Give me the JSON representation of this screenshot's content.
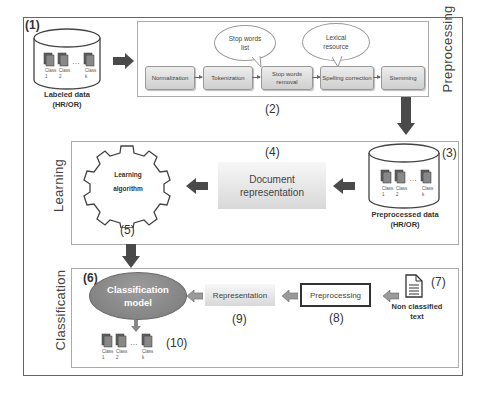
{
  "diagram": {
    "sections": {
      "preprocessing": "Preprocessing",
      "learning": "Learning",
      "classification": "Classification"
    },
    "labeled_data": {
      "number": "(1)",
      "label_line1": "Labeled data",
      "label_line2": "(HR/OR)",
      "classes": [
        {
          "name": "Class",
          "index": "1"
        },
        {
          "name": "Class",
          "index": "2"
        },
        {
          "name": "Class",
          "index": "k"
        }
      ],
      "ellipsis": "..."
    },
    "pipeline": {
      "number": "(2)",
      "steps": [
        "Normalization",
        "Tokenization",
        "Stop words removal",
        "Spelling correction",
        "Stemming"
      ],
      "bubbles": [
        {
          "line1": "Stop words",
          "line2": "list"
        },
        {
          "line1": "Lexical",
          "line2": "resource"
        }
      ]
    },
    "preprocessed_data": {
      "number": "(3)",
      "label_line1": "Preprocessed data",
      "label_line2": "(HR/OR)",
      "classes": [
        {
          "name": "Class",
          "index": "1"
        },
        {
          "name": "Class",
          "index": "2"
        },
        {
          "name": "Class",
          "index": "k"
        }
      ],
      "ellipsis": "..."
    },
    "document_representation": {
      "number": "(4)",
      "line1": "Document",
      "line2": "representation"
    },
    "learning_algorithm": {
      "number": "(5)",
      "line1": "Learning",
      "line2": "algorithm"
    },
    "classification_model": {
      "number": "(6)",
      "line1": "Classification",
      "line2": "model"
    },
    "non_classified_text": {
      "number": "(7)",
      "line1": "Non classified",
      "line2": "text"
    },
    "preprocessing_box": {
      "number": "(8)",
      "label": "Preprocessing"
    },
    "representation_box": {
      "number": "(9)",
      "label": "Representation"
    },
    "output_classes": {
      "number": "(10)",
      "classes": [
        {
          "name": "Class",
          "index": "1"
        },
        {
          "name": "Class",
          "index": "2"
        },
        {
          "name": "Class",
          "index": "k"
        }
      ],
      "ellipsis": "..."
    },
    "colors": {
      "arrow": "#4a4a4a",
      "model_ellipse": "#8a8a8a",
      "box_gradient_top": "#f7f7f7",
      "box_gradient_bottom": "#d8d8d8"
    }
  }
}
